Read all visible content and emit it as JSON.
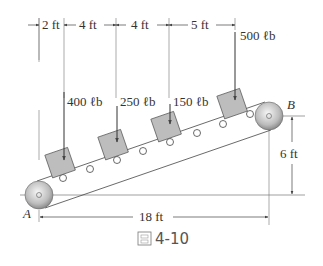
{
  "figure": {
    "caption": "圖 4-10",
    "caption_icon": "figure-glyph-icon",
    "caption_number": "4-10"
  },
  "dimensions": {
    "top": [
      "2 ft",
      "4 ft",
      "4 ft",
      "5 ft"
    ],
    "horizontal": "18 ft",
    "vertical": "6 ft"
  },
  "loads": [
    {
      "label": "400 ℓb"
    },
    {
      "label": "250 ℓb"
    },
    {
      "label": "150 ℓb"
    },
    {
      "label": "500 ℓb"
    }
  ],
  "points": {
    "A": "A",
    "B": "B"
  },
  "colors": {
    "line": "#444444",
    "box_fill": "#bdbdbd",
    "pulley_light": "#f4f4f4",
    "pulley_dark": "#8a8a8a"
  }
}
